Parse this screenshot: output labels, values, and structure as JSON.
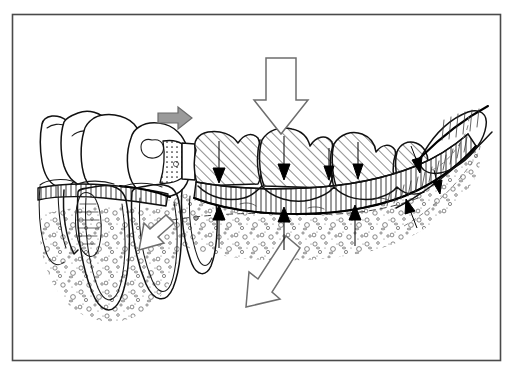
{
  "figure": {
    "caption": "",
    "background_color": "#ffffff",
    "frame": {
      "name": "illustration-border",
      "x": 12,
      "y": 14,
      "width": 488,
      "height": 346,
      "stroke_color": "#4a4a4a",
      "stroke_width": 1.6
    },
    "style": {
      "ink_color": "#111111",
      "hatch_color": "#222222",
      "stipple_color": "#555555",
      "gray_arrow_fill": "#9a9a9a",
      "gray_arrow_stroke": "#6a6a6a",
      "hollow_arrow_fill": "#ffffff",
      "hollow_arrow_stroke": "#6e6e6e",
      "black_arrow_fill": "#000000"
    }
  },
  "anatomy": {
    "natural_teeth": [
      {
        "label": "incisor",
        "shading": "outline-only"
      },
      {
        "label": "canine",
        "shading": "outline-only"
      },
      {
        "label": "premolar-abutment",
        "shading": "outline-only"
      }
    ],
    "denture_teeth": [
      {
        "label": "artificial-tooth-1",
        "shading": "diagonal-hatch"
      },
      {
        "label": "artificial-tooth-2",
        "shading": "diagonal-hatch"
      },
      {
        "label": "artificial-tooth-3",
        "shading": "diagonal-hatch"
      },
      {
        "label": "artificial-tooth-4",
        "shading": "diagonal-hatch"
      }
    ],
    "denture_base": {
      "label": "acrylic-denture-base",
      "shading": "vertical-tick"
    },
    "residual_ridge": {
      "label": "residual-alveolar-ridge",
      "shading": "stipple"
    },
    "retromolar_pad": {
      "label": "retromolar-pad",
      "shading": "outline-only"
    },
    "mucosa_band": {
      "label": "mucosa-over-ridge",
      "shading": "vertical-tick"
    },
    "rest_seat": {
      "label": "occlusal-rest-and-clasp",
      "shading": "dotted"
    },
    "trabecular_bone": {
      "label": "trabecular-bone-stipple",
      "shading": "stipple"
    },
    "periodontal_ligament": {
      "label": "periodontal-ligament-outline",
      "shading": "outline-only"
    }
  },
  "arrows": {
    "gray": [
      {
        "name": "mesial-drift-arrow",
        "direction": "right",
        "color": "#9a9a9a"
      }
    ],
    "hollow": [
      {
        "name": "occlusal-load-arrow",
        "direction": "down",
        "color": "#ffffff"
      },
      {
        "name": "root-stress-arrow",
        "direction": "down-left",
        "color": "#ffffff"
      },
      {
        "name": "ridge-resorption-arrow",
        "direction": "down-left",
        "color": "#ffffff"
      }
    ],
    "black_down": [
      {
        "name": "tooth-load-arrow-1",
        "direction": "down"
      },
      {
        "name": "tooth-load-arrow-2",
        "direction": "down"
      },
      {
        "name": "tooth-load-arrow-3",
        "direction": "down"
      },
      {
        "name": "tooth-load-arrow-4",
        "direction": "down"
      },
      {
        "name": "distal-load-arrow-1",
        "direction": "down-right"
      },
      {
        "name": "distal-load-arrow-2",
        "direction": "down-right"
      }
    ],
    "black_up": [
      {
        "name": "tissue-reaction-arrow-1",
        "direction": "up"
      },
      {
        "name": "tissue-reaction-arrow-2",
        "direction": "up"
      },
      {
        "name": "tissue-reaction-arrow-3",
        "direction": "up"
      },
      {
        "name": "tissue-reaction-arrow-4",
        "direction": "up"
      }
    ]
  }
}
